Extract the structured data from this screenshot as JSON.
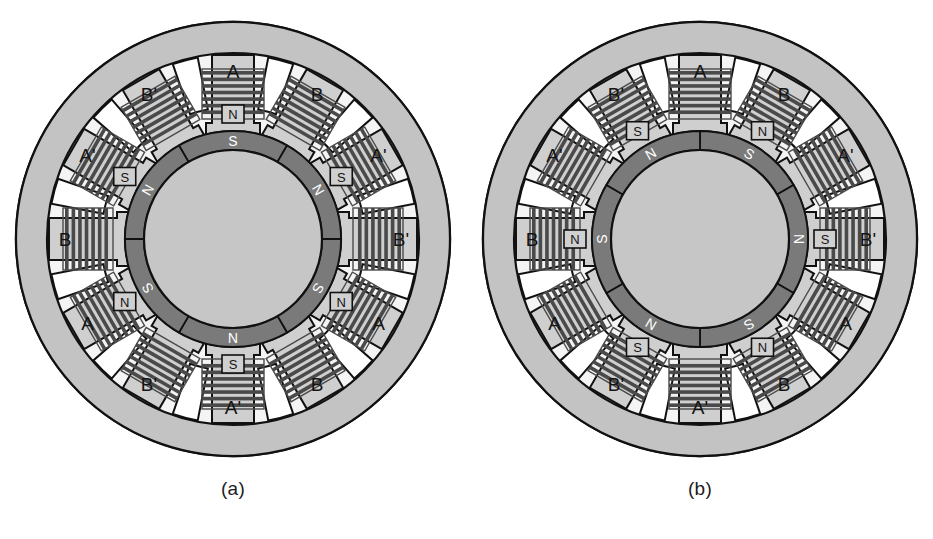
{
  "figure": {
    "type": "technical-diagram"
  },
  "colors": {
    "outline": "#111111",
    "stator_body": "#c3c3c3",
    "stator_tooth": "#cfcfcf",
    "coil": "#4a4a4a",
    "rotor_ring": "#7a7a7a",
    "rotor_hub": "#c6c6c6",
    "pole_text": "#ffffff",
    "tip_box": "#d0d0d0",
    "background": "#ffffff"
  },
  "panels": [
    {
      "caption": "(a)",
      "stator_teeth": [
        {
          "label": "A",
          "angle": -90,
          "tip": "N"
        },
        {
          "label": "B",
          "angle": -60,
          "tip": ""
        },
        {
          "label": "A'",
          "angle": -30,
          "tip": "S"
        },
        {
          "label": "B'",
          "angle": 0,
          "tip": ""
        },
        {
          "label": "A",
          "angle": 30,
          "tip": "N"
        },
        {
          "label": "B",
          "angle": 60,
          "tip": ""
        },
        {
          "label": "A'",
          "angle": 90,
          "tip": "S"
        },
        {
          "label": "B'",
          "angle": 120,
          "tip": ""
        },
        {
          "label": "A",
          "angle": 150,
          "tip": "N"
        },
        {
          "label": "B",
          "angle": 180,
          "tip": ""
        },
        {
          "label": "A'",
          "angle": 210,
          "tip": "S"
        },
        {
          "label": "B'",
          "angle": 240,
          "tip": ""
        }
      ],
      "rotor_poles": [
        {
          "pole": "S",
          "angle": -90
        },
        {
          "pole": "N",
          "angle": -30
        },
        {
          "pole": "S",
          "angle": 30
        },
        {
          "pole": "N",
          "angle": 90
        },
        {
          "pole": "S",
          "angle": 150
        },
        {
          "pole": "N",
          "angle": 210
        }
      ]
    },
    {
      "caption": "(b)",
      "stator_teeth": [
        {
          "label": "A",
          "angle": -90,
          "tip": ""
        },
        {
          "label": "B",
          "angle": -60,
          "tip": "N"
        },
        {
          "label": "A'",
          "angle": -30,
          "tip": ""
        },
        {
          "label": "B'",
          "angle": 0,
          "tip": "S"
        },
        {
          "label": "A",
          "angle": 30,
          "tip": ""
        },
        {
          "label": "B",
          "angle": 60,
          "tip": "N"
        },
        {
          "label": "A'",
          "angle": 90,
          "tip": ""
        },
        {
          "label": "B'",
          "angle": 120,
          "tip": "S"
        },
        {
          "label": "A",
          "angle": 150,
          "tip": ""
        },
        {
          "label": "B",
          "angle": 180,
          "tip": "N"
        },
        {
          "label": "A'",
          "angle": 210,
          "tip": ""
        },
        {
          "label": "B'",
          "angle": 240,
          "tip": "S"
        }
      ],
      "rotor_poles": [
        {
          "pole": "S",
          "angle": -60
        },
        {
          "pole": "N",
          "angle": 0
        },
        {
          "pole": "S",
          "angle": 60
        },
        {
          "pole": "N",
          "angle": 120
        },
        {
          "pole": "S",
          "angle": 180
        },
        {
          "pole": "N",
          "angle": 240
        }
      ]
    }
  ]
}
